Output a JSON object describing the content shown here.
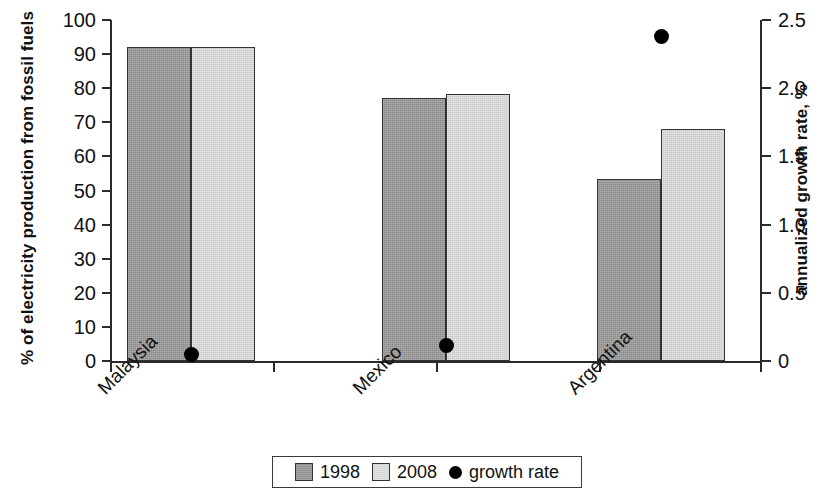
{
  "chart_data": {
    "type": "bar",
    "title": "",
    "subtitle": "",
    "categories": [
      "Malaysia",
      "Mexico",
      "Argentina"
    ],
    "series": [
      {
        "name": "1998",
        "values": [
          92.2,
          77.2,
          53.5
        ],
        "color": "#9a9a9a",
        "axis": "left"
      },
      {
        "name": "2008",
        "values": [
          92.2,
          78.3,
          68.0
        ],
        "color": "#d9d9d9",
        "axis": "left"
      },
      {
        "name": "growth rate",
        "values": [
          0.05,
          0.11,
          2.38
        ],
        "color": "#000000",
        "axis": "right",
        "marker": "circle"
      }
    ],
    "xlabel": "",
    "ylabel": "% of electricity production from fossil fuels",
    "ylabel_right": "annualized growth rate, %",
    "ylim": [
      0,
      100
    ],
    "ylim_right": [
      0,
      2.5
    ],
    "yticks": [
      "0",
      "10",
      "20",
      "30",
      "40",
      "50",
      "60",
      "70",
      "80",
      "90",
      "100"
    ],
    "yticks_right": [
      "0",
      "0.5",
      "1.0",
      "1.5",
      "2.0",
      "2.5"
    ],
    "grid": false,
    "legend_position": "bottom-center"
  },
  "axes": {
    "left_title": "% of electricity production from fossil fuels",
    "right_title": "annualized growth rate, %",
    "left_ticks": [
      "100",
      "90",
      "80",
      "70",
      "60",
      "50",
      "40",
      "30",
      "20",
      "10",
      "0"
    ],
    "right_ticks": [
      "2.5",
      "2.0",
      "1.5",
      "1.0",
      "0.5",
      "0"
    ]
  },
  "categories": [
    {
      "label": "Malaysia"
    },
    {
      "label": "Mexico"
    },
    {
      "label": "Argentina"
    }
  ],
  "legend": {
    "items": [
      {
        "label": "1998",
        "marker": "square-dark"
      },
      {
        "label": "2008",
        "marker": "square-light"
      },
      {
        "label": "growth rate",
        "marker": "dot-black"
      }
    ]
  }
}
